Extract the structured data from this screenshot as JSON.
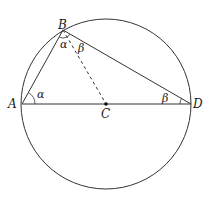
{
  "diagram": {
    "type": "geometry",
    "points": {
      "A": {
        "label": "A",
        "x": 22,
        "y": 104
      },
      "B": {
        "label": "B",
        "x": 63,
        "y": 30
      },
      "C": {
        "label": "C",
        "x": 106,
        "y": 104
      },
      "D": {
        "label": "D",
        "x": 191,
        "y": 104
      }
    },
    "circle": {
      "cx": 106,
      "cy": 104,
      "r": 85
    },
    "segments": [
      {
        "from": "A",
        "to": "B",
        "style": "solid"
      },
      {
        "from": "B",
        "to": "D",
        "style": "solid"
      },
      {
        "from": "A",
        "to": "D",
        "style": "solid"
      },
      {
        "from": "B",
        "to": "C",
        "style": "dashed"
      }
    ],
    "angles": [
      {
        "vertex": "A",
        "label": "α"
      },
      {
        "vertex": "B",
        "label": "α",
        "between": "BA-BC"
      },
      {
        "vertex": "B",
        "label": "β",
        "between": "BC-BD"
      },
      {
        "vertex": "D",
        "label": "β"
      }
    ],
    "colors": {
      "stroke": "#333333",
      "background": "#ffffff"
    }
  }
}
